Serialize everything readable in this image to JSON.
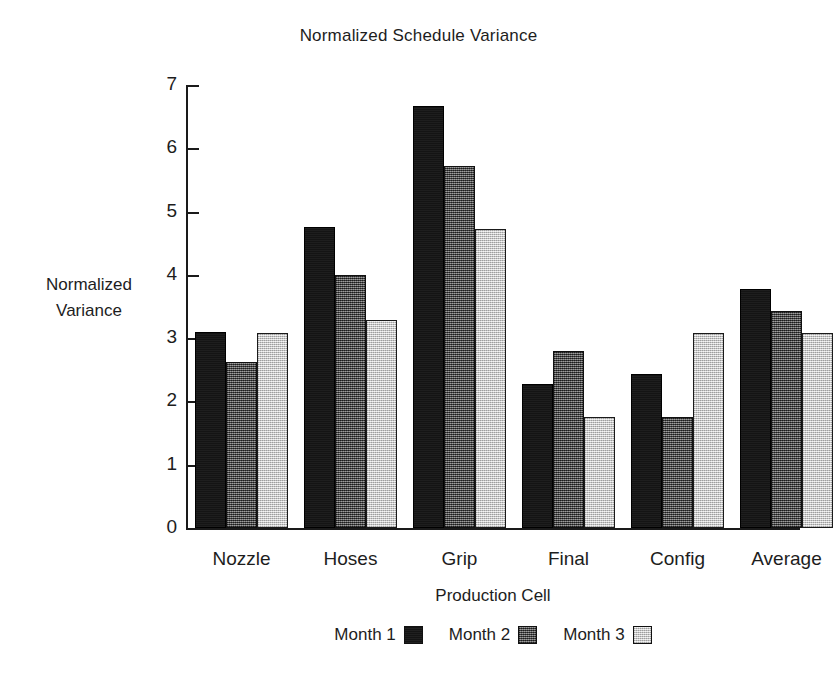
{
  "chart_data": {
    "type": "bar",
    "title": "Normalized Schedule Variance",
    "xlabel": "Production Cell",
    "ylabel": "Normalized Variance",
    "ylabel_lines": [
      "Normalized",
      "Variance"
    ],
    "categories": [
      "Nozzle",
      "Hoses",
      "Grip",
      "Final",
      "Config",
      "Average"
    ],
    "series": [
      {
        "name": "Month 1",
        "color": "#141414",
        "values": [
          3.1,
          4.75,
          6.67,
          2.27,
          2.43,
          3.78
        ]
      },
      {
        "name": "Month 2",
        "color": "#4a4a4a",
        "values": [
          2.62,
          4.0,
          5.72,
          2.8,
          1.75,
          3.43
        ]
      },
      {
        "name": "Month 3",
        "color": "#d6d6d6",
        "values": [
          3.08,
          3.28,
          4.72,
          1.75,
          3.08,
          3.08
        ]
      }
    ],
    "ylim": [
      0,
      7
    ],
    "ytick_labels": [
      "0",
      "1",
      "2",
      "3",
      "4",
      "5",
      "6",
      "7"
    ],
    "ytick_values": [
      0,
      1,
      2,
      3,
      4,
      5,
      6,
      7
    ],
    "grid": false,
    "legend_position": "bottom"
  },
  "caption": {
    "fragment": ""
  }
}
